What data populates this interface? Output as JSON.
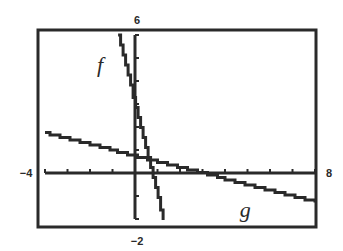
{
  "chart_data": {
    "type": "line",
    "title": "",
    "xlabel": "",
    "ylabel": "",
    "xlim": [
      -4,
      8
    ],
    "ylim": [
      -2,
      6
    ],
    "x_tick_step": 1,
    "y_tick_step": 1,
    "grid": false,
    "legend": "none",
    "window_labels": {
      "xmin": "−4",
      "xmax": "8",
      "ymin": "−2",
      "ymax": "6"
    },
    "series": [
      {
        "name": "f",
        "label": "f",
        "equation": "y = -4x + 3",
        "slope": -4,
        "intercept": 3,
        "points": [
          {
            "x": -0.75,
            "y": 6
          },
          {
            "x": 1.25,
            "y": -2
          }
        ]
      },
      {
        "name": "g",
        "label": "g",
        "equation": "y = -0.25x + 0.75",
        "slope": -0.25,
        "intercept": 0.75,
        "points": [
          {
            "x": -4,
            "y": 1.75
          },
          {
            "x": 8,
            "y": -1.25
          }
        ]
      }
    ],
    "annotations": [
      {
        "text": "f",
        "x": -1.55,
        "y": 4.7
      },
      {
        "text": "g",
        "x": 4.9,
        "y": -1.6
      }
    ],
    "intersections": [
      {
        "x": 0.6,
        "y": 0.6,
        "between": [
          "f",
          "g"
        ]
      }
    ]
  },
  "colors": {
    "ink": "#2a2a2a",
    "background": "#ffffff"
  },
  "layout": {
    "frame": {
      "left": 38,
      "top": 30,
      "right": 316,
      "bottom": 227
    },
    "origin_px": {
      "x": 135,
      "y": 173
    },
    "px_per_unit_x": 22.5,
    "px_per_unit_y": 23
  }
}
